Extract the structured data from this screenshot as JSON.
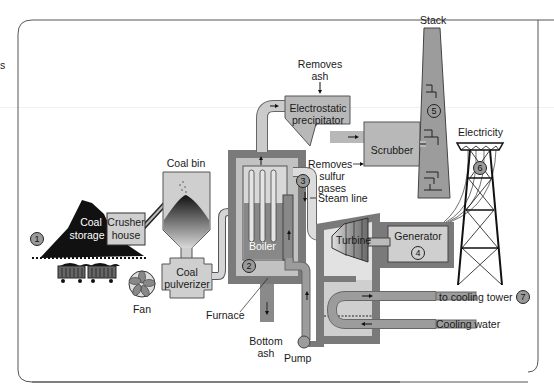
{
  "diagram": {
    "cut_off_text": "s",
    "colors": {
      "background": "#ffffff",
      "frame": "#555555",
      "light_gray": "#c8c8c8",
      "mid_gray": "#9c9c9c",
      "dark_gray": "#6e6e6e",
      "pale_gray": "#e2e2e2",
      "coal_black": "#111111"
    },
    "components": {
      "coal_storage": {
        "label_line1": "Coal",
        "label_line2": "storage",
        "number": "1"
      },
      "crusher_house": {
        "label_line1": "Crusher",
        "label_line2": "house"
      },
      "coal_bin": {
        "label": "Coal bin"
      },
      "fan": {
        "label": "Fan"
      },
      "coal_pulverizer": {
        "label_line1": "Coal",
        "label_line2": "pulverizer"
      },
      "furnace": {
        "label": "Furnace",
        "number": "2"
      },
      "boiler": {
        "label": "Boiler"
      },
      "bottom_ash": {
        "label_line1": "Bottom",
        "label_line2": "ash"
      },
      "steam_line": {
        "label": "Steam line",
        "number": "3"
      },
      "electrostatic_precipitator": {
        "label_line1": "Electrostatic",
        "label_line2": "precipitator",
        "note_line1": "Removes",
        "note_line2": "ash"
      },
      "scrubber": {
        "label": "Scrubber",
        "note_line1": "Removes",
        "note_line2": "sulfur",
        "note_line3": "gases"
      },
      "stack": {
        "label": "Stack",
        "number": "5"
      },
      "electricity": {
        "label": "Electricity",
        "number": "6"
      },
      "turbine": {
        "label": "Turbine"
      },
      "generator": {
        "label": "Generator",
        "number": "4"
      },
      "pump": {
        "label": "Pump"
      },
      "cooling_tower": {
        "label": "to cooling tower",
        "number": "7"
      },
      "cooling_water": {
        "label": "Cooling water"
      }
    }
  }
}
